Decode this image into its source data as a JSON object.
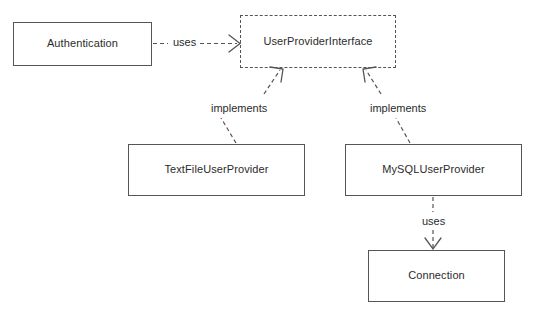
{
  "diagram": {
    "type": "uml-class-diagram",
    "background_color": "#ffffff",
    "stroke_color": "#555555",
    "text_color": "#2b2b2b",
    "nodes": [
      {
        "id": "authentication",
        "label": "Authentication",
        "kind": "class",
        "border_style": "solid",
        "x": 13,
        "y": 22,
        "w": 139,
        "h": 44
      },
      {
        "id": "user_provider_interface",
        "label": "UserProviderInterface",
        "kind": "interface",
        "border_style": "dashed",
        "x": 240,
        "y": 15,
        "w": 156,
        "h": 53
      },
      {
        "id": "textfile_user_provider",
        "label": "TextFileUserProvider",
        "kind": "class",
        "border_style": "solid",
        "x": 128,
        "y": 144,
        "w": 177,
        "h": 52
      },
      {
        "id": "mysql_user_provider",
        "label": "MySQLUserProvider",
        "kind": "class",
        "border_style": "solid",
        "x": 345,
        "y": 144,
        "w": 177,
        "h": 52
      },
      {
        "id": "connection",
        "label": "Connection",
        "kind": "class",
        "border_style": "solid",
        "x": 368,
        "y": 250,
        "w": 137,
        "h": 52
      }
    ],
    "edges": [
      {
        "id": "auth-uses-interface",
        "label": "uses",
        "from": "authentication",
        "to": "user_provider_interface",
        "style": "dashed",
        "arrow": "open",
        "label_x": 174,
        "label_y": 37
      },
      {
        "id": "textfile-implements-interface",
        "label": "implements",
        "from": "textfile_user_provider",
        "to": "user_provider_interface",
        "style": "dashed",
        "arrow": "open",
        "label_x": 209,
        "label_y": 103
      },
      {
        "id": "mysql-implements-interface",
        "label": "implements",
        "from": "mysql_user_provider",
        "to": "user_provider_interface",
        "style": "dashed",
        "arrow": "open",
        "label_x": 368,
        "label_y": 103
      },
      {
        "id": "mysql-uses-connection",
        "label": "uses",
        "from": "mysql_user_provider",
        "to": "connection",
        "style": "dashed",
        "arrow": "open",
        "label_x": 420,
        "label_y": 218
      }
    ]
  }
}
